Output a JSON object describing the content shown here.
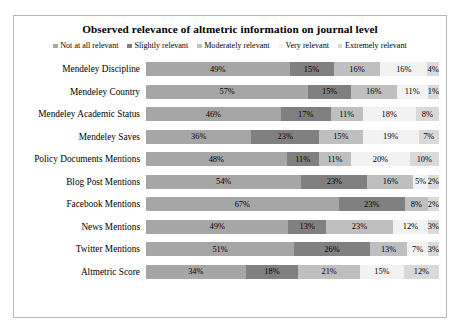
{
  "chart": {
    "title": "Observed relevance of altmetric information on journal level",
    "legend": [
      {
        "label": "Not at all relevant",
        "color": "#a6a6a6"
      },
      {
        "label": "Slightly relevant",
        "color": "#808080"
      },
      {
        "label": "Moderately relevant",
        "color": "#bfbfbf"
      },
      {
        "label": "Very relevant",
        "color": "#f2f2f2"
      },
      {
        "label": "Extremely relevant",
        "color": "#d9d9d9"
      }
    ]
  },
  "chart_data": {
    "type": "bar",
    "orientation": "horizontal",
    "stacked": true,
    "normalized": true,
    "title": "Observed relevance of altmetric information on journal level",
    "xlabel": "",
    "ylabel": "",
    "xlim": [
      0,
      100
    ],
    "grid": false,
    "legend_position": "top",
    "legend_entries": [
      "Not at all relevant",
      "Slightly relevant",
      "Moderately relevant",
      "Very relevant",
      "Extremely relevant"
    ],
    "colors": [
      "#a6a6a6",
      "#808080",
      "#bfbfbf",
      "#f2f2f2",
      "#d9d9d9"
    ],
    "categories": [
      "Mendeley Discipline",
      "Mendeley Country",
      "Mendeley Academic Status",
      "Mendeley Saves",
      "Policy Documents Mentions",
      "Blog Post Mentions",
      "Facebook Mentions",
      "News Mentions",
      "Twitter Mentions",
      "Altmetric Score"
    ],
    "series": [
      {
        "name": "Not at all relevant",
        "values": [
          49,
          57,
          46,
          36,
          48,
          54,
          67,
          49,
          51,
          34
        ]
      },
      {
        "name": "Slightly relevant",
        "values": [
          15,
          15,
          17,
          23,
          11,
          23,
          23,
          13,
          26,
          18
        ]
      },
      {
        "name": "Moderately relevant",
        "values": [
          16,
          16,
          11,
          15,
          11,
          16,
          8,
          23,
          13,
          21
        ]
      },
      {
        "name": "Very relevant",
        "values": [
          16,
          11,
          18,
          19,
          20,
          5,
          0,
          12,
          7,
          15
        ]
      },
      {
        "name": "Extremely relevant",
        "values": [
          4,
          1,
          8,
          7,
          10,
          2,
          2,
          3,
          3,
          12
        ]
      }
    ],
    "labels": [
      [
        "49%",
        "15%",
        "16%",
        "16%",
        "4%"
      ],
      [
        "57%",
        "15%",
        "16%",
        "11%",
        "1%"
      ],
      [
        "46%",
        "17%",
        "11%",
        "18%",
        "8%"
      ],
      [
        "36%",
        "23%",
        "15%",
        "19%",
        "7%"
      ],
      [
        "48%",
        "11%",
        "11%",
        "20%",
        "10%"
      ],
      [
        "54%",
        "23%",
        "16%",
        "5%",
        "2%"
      ],
      [
        "67%",
        "23%",
        "8%",
        "",
        "2%"
      ],
      [
        "49%",
        "13%",
        "23%",
        "12%",
        "3%"
      ],
      [
        "51%",
        "26%",
        "13%",
        "7%",
        "3%"
      ],
      [
        "34%",
        "18%",
        "21%",
        "15%",
        "12%"
      ]
    ]
  }
}
